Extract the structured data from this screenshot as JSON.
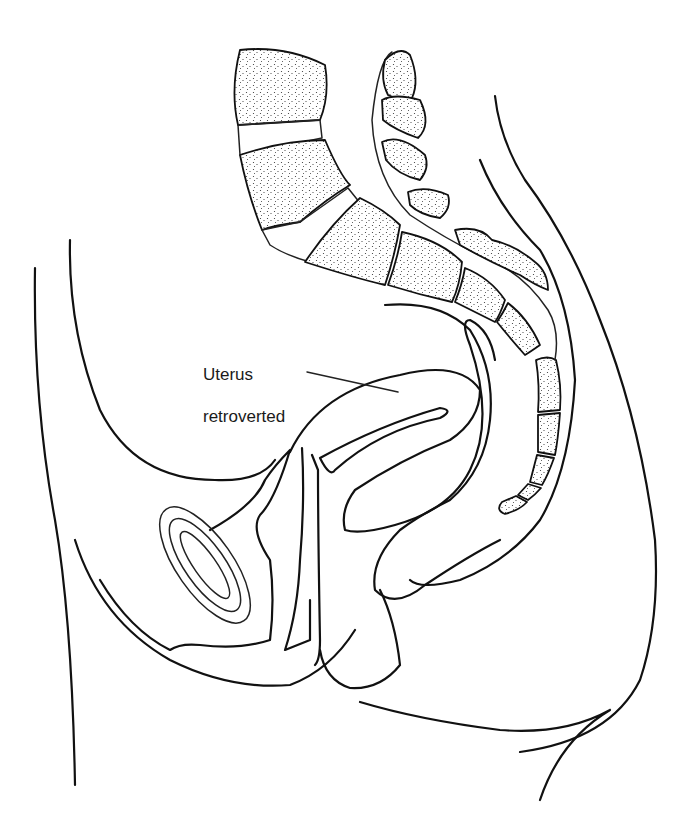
{
  "diagram": {
    "type": "anatomical line drawing",
    "view": "sagittal section of female pelvis",
    "labels": [
      {
        "id": "uterus",
        "line1": "Uterus",
        "line2": "retroverted"
      }
    ],
    "colors": {
      "line": "#111111",
      "background": "#ffffff",
      "stipple": "#333333"
    }
  }
}
